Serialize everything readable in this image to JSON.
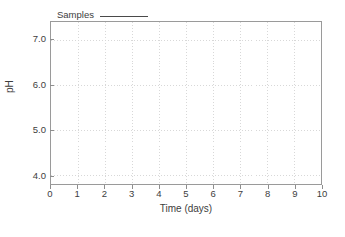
{
  "chart_data": {
    "type": "line",
    "title": "",
    "xlabel": "Time (days)",
    "ylabel": "pH",
    "xlim": [
      0,
      10
    ],
    "ylim": [
      3.8,
      7.4
    ],
    "xticks": [
      "0",
      "1",
      "2",
      "3",
      "4",
      "5",
      "6",
      "7",
      "8",
      "9",
      "10"
    ],
    "xtick_values": [
      0,
      1,
      2,
      3,
      4,
      5,
      6,
      7,
      8,
      9,
      10
    ],
    "yticks": [
      "7.0",
      "6.0",
      "5.0",
      "4.0"
    ],
    "ytick_values": [
      7.0,
      6.0,
      5.0,
      4.0
    ],
    "grid": true,
    "grid_style": "dotted",
    "grid_color": "#d8d8d8",
    "legend_position": "above-left",
    "series": [
      {
        "name": "Samples",
        "marker": "line",
        "color": "#4a4a4a",
        "x": [],
        "values": []
      }
    ],
    "annotations": [],
    "note": "empty plot area - no data points drawn"
  },
  "legend": {
    "entries": [
      {
        "label": "Samples",
        "swatch": "solid-line"
      }
    ]
  },
  "colors": {
    "frame": "#9a9a9a",
    "text": "#3d3d3d",
    "grid": "#d8d8d8",
    "series": "#4a4a4a",
    "background": "#ffffff"
  }
}
